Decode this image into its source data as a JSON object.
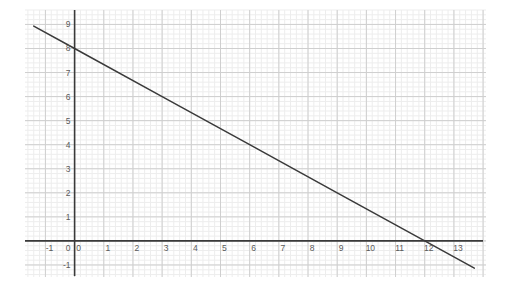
{
  "chart_data": {
    "type": "line",
    "title": "",
    "subtitle": "",
    "xlabel": "",
    "ylabel": "",
    "xlim": [
      -1.7,
      14.1
    ],
    "ylim": [
      -1.5,
      9.6
    ],
    "xticks": [
      -1,
      0,
      1,
      2,
      3,
      4,
      5,
      6,
      7,
      8,
      9,
      10,
      11,
      12,
      13
    ],
    "yticks": [
      -1,
      0,
      1,
      2,
      3,
      4,
      5,
      6,
      7,
      8,
      9
    ],
    "xtick_labels": [
      "-1",
      "0",
      "1",
      "2",
      "3",
      "4",
      "5",
      "6",
      "7",
      "8",
      "9",
      "10",
      "11",
      "12",
      "13"
    ],
    "ytick_labels": [
      "-1",
      "0",
      "1",
      "2",
      "3",
      "4",
      "5",
      "6",
      "7",
      "8",
      "9"
    ],
    "grid": true,
    "minor_grid": true,
    "minor_ticks_per_unit": 5,
    "legend": false,
    "legend_position": "none",
    "series": [
      {
        "name": "line",
        "equation": "y = 8 - (2/3)x",
        "slope": -0.6667,
        "y_intercept": 8,
        "x_intercept": 12,
        "color": "#3a3a3a",
        "points": [
          {
            "x": -1.4,
            "y": 8.93
          },
          {
            "x": 0,
            "y": 8
          },
          {
            "x": 3,
            "y": 6
          },
          {
            "x": 6,
            "y": 4
          },
          {
            "x": 9,
            "y": 2
          },
          {
            "x": 12,
            "y": 0
          },
          {
            "x": 13.7,
            "y": -1.13
          }
        ]
      }
    ],
    "axes": {
      "x_axis_color": "#3a3a3a",
      "y_axis_color": "#3a3a3a",
      "x_axis_y_value": 0,
      "y_axis_x_value": 0
    },
    "colors": {
      "background": "#ffffff",
      "minor_grid": "#ededed",
      "major_grid": "#cfcfcf",
      "axis": "#3a3a3a",
      "line": "#3a3a3a",
      "tick_text": "#5a5a5a"
    }
  }
}
